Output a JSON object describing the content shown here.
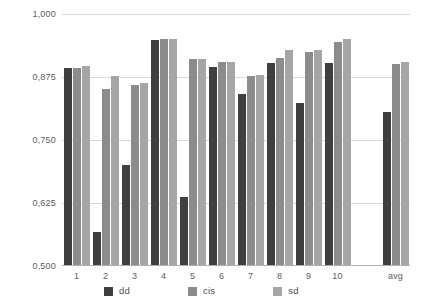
{
  "chart_data": {
    "type": "bar",
    "title": "",
    "xlabel": "",
    "ylabel": "",
    "ylim": [
      0.5,
      1.0
    ],
    "grid": true,
    "legend_position": "bottom",
    "categories": [
      "1",
      "2",
      "3",
      "4",
      "5",
      "6",
      "7",
      "8",
      "9",
      "10",
      "",
      "avg"
    ],
    "y_ticks": [
      1.0,
      0.875,
      0.75,
      0.625,
      0.5
    ],
    "y_tick_labels": [
      "1,000",
      "0,875",
      "0,750",
      "0,625",
      "0,500"
    ],
    "series": [
      {
        "name": "dd",
        "color": "#3f3f3f",
        "values": [
          0.893,
          0.568,
          0.701,
          0.948,
          0.637,
          0.894,
          0.841,
          0.903,
          0.823,
          0.903,
          null,
          0.805
        ]
      },
      {
        "name": "cis",
        "color": "#8c8c8c",
        "values": [
          0.893,
          0.851,
          0.86,
          0.95,
          0.91,
          0.905,
          0.877,
          0.913,
          0.925,
          0.945,
          null,
          0.9
        ]
      },
      {
        "name": "sd",
        "color": "#a6a6a6",
        "values": [
          0.897,
          0.876,
          0.864,
          0.95,
          0.91,
          0.905,
          0.879,
          0.929,
          0.929,
          0.95,
          null,
          0.905
        ]
      }
    ]
  },
  "legend": {
    "items": [
      {
        "label": "dd",
        "swatch": "series-dd"
      },
      {
        "label": "cis",
        "swatch": "series-cis"
      },
      {
        "label": "sd",
        "swatch": "series-sd"
      }
    ]
  }
}
